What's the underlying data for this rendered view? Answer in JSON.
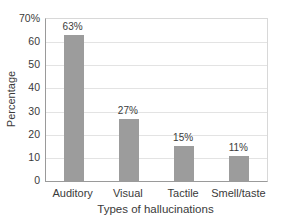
{
  "chart_data": {
    "type": "bar",
    "title": "",
    "categories": [
      "Auditory",
      "Visual",
      "Tactile",
      "Smell/taste"
    ],
    "values": [
      63,
      27,
      15,
      11
    ],
    "value_labels": [
      "63%",
      "27%",
      "15%",
      "11%"
    ],
    "xlabel": "Types of hallucinations",
    "ylabel": "Percentage",
    "ylim": [
      0,
      70
    ],
    "yticks": [
      {
        "value": 70,
        "label": "70%"
      },
      {
        "value": 60,
        "label": "60"
      },
      {
        "value": 50,
        "label": "50"
      },
      {
        "value": 40,
        "label": "40"
      },
      {
        "value": 30,
        "label": "30"
      },
      {
        "value": 20,
        "label": "20"
      },
      {
        "value": 10,
        "label": "10"
      },
      {
        "value": 0,
        "label": "0"
      }
    ],
    "grid": true,
    "legend": "none",
    "bar_color": "#9c9c9c",
    "gridline_color": "#e3e3e3",
    "axis_color": "#9a9a9a",
    "frame_color": "#d8d8d8",
    "text_color": "#3a3a3a",
    "background_color": "#ffffff"
  }
}
